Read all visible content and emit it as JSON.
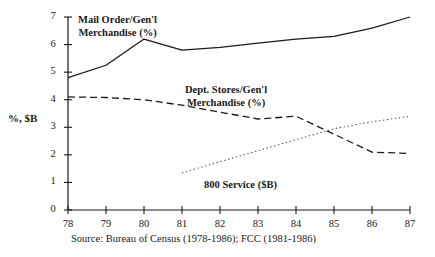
{
  "chart_data": {
    "type": "line",
    "title": "",
    "xlabel": "",
    "ylabel": "%, $B",
    "xlim": [
      78,
      87
    ],
    "ylim": [
      0,
      7
    ],
    "grid": false,
    "legend_position": "inline-annotations",
    "x": [
      78,
      79,
      80,
      81,
      82,
      83,
      84,
      85,
      86,
      87
    ],
    "xtick_labels": [
      "78",
      "79",
      "80",
      "81",
      "82",
      "83",
      "84",
      "85",
      "86",
      "87"
    ],
    "ytick_labels": [
      "0",
      "1",
      "2",
      "3",
      "4",
      "5",
      "6",
      "7"
    ],
    "series": [
      {
        "name": "Mail Order/Gen'l Merchandise (%)",
        "style": "solid",
        "color": "#1a1a1a",
        "x": [
          78,
          79,
          80,
          81,
          82,
          83,
          84,
          85,
          86,
          87
        ],
        "values": [
          4.8,
          5.25,
          6.2,
          5.8,
          5.9,
          6.05,
          6.2,
          6.3,
          6.6,
          7.0
        ]
      },
      {
        "name": "Dept. Stores/Gen'l Merchandise (%)",
        "style": "dashed",
        "color": "#1a1a1a",
        "x": [
          78,
          79,
          80,
          81,
          82,
          83,
          84,
          85,
          86,
          87
        ],
        "values": [
          4.1,
          4.08,
          4.0,
          3.8,
          3.55,
          3.3,
          3.4,
          2.75,
          2.1,
          2.05
        ]
      },
      {
        "name": "800 Service ($B)",
        "style": "dotted",
        "color": "#555555",
        "x": [
          81,
          82,
          83,
          84,
          85,
          86,
          87
        ],
        "values": [
          1.35,
          1.75,
          2.15,
          2.55,
          2.95,
          3.2,
          3.4
        ]
      }
    ],
    "annotations": [
      {
        "name": "mail-order-label",
        "line1": "Mail Order/Gen'l",
        "line2": "Merchandise (%)"
      },
      {
        "name": "dept-stores-label",
        "line1": "Dept. Stores/Gen'l",
        "line2": "Merchandise (%)"
      },
      {
        "name": "service-800-label",
        "line1": "800 Service ($B)",
        "line2": ""
      }
    ],
    "source": "Source: Bureau of Census (1978-1986); FCC (1981-1986)"
  }
}
